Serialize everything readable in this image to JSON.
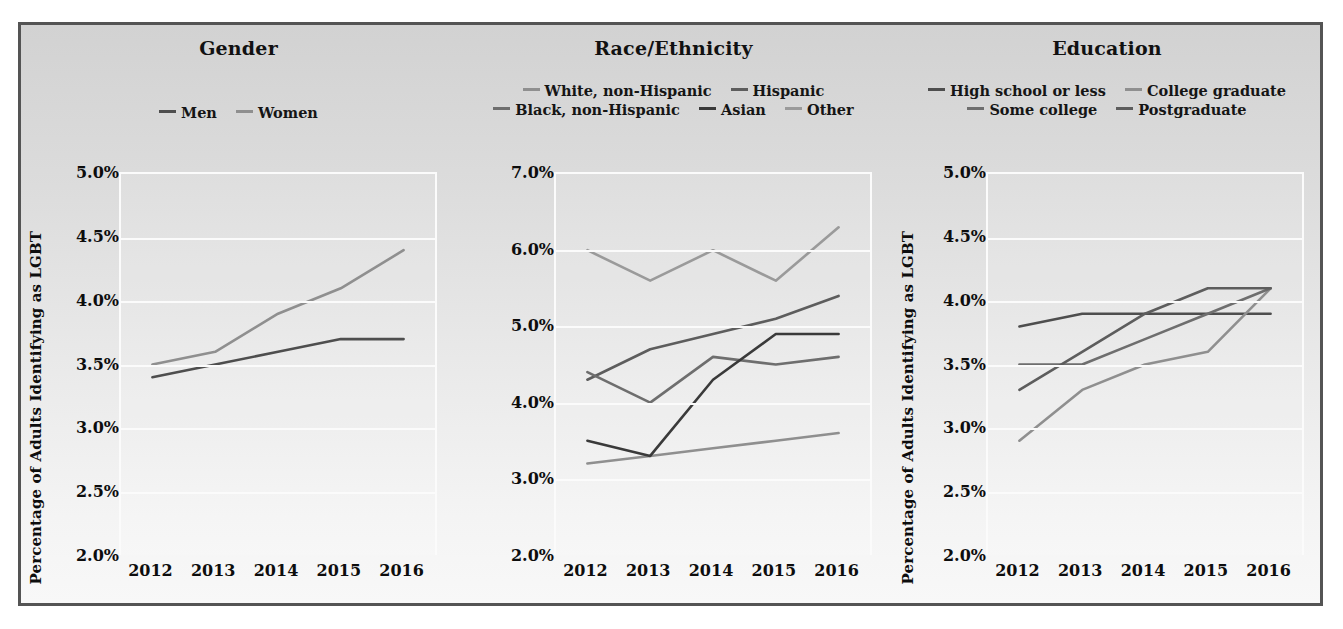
{
  "figure": {
    "background": "#dcdcdc",
    "border_color": "#545454",
    "ylabel": "Percentage of Adults Identifying as LGBT"
  },
  "colors": {
    "dark": "#4e4e4e",
    "mid_dark": "#5d5d5d",
    "mid": "#6e6e6e",
    "light": "#8f8f8f",
    "lighter": "#9a9a9a",
    "black": "#3a3a3a",
    "gridline": "#fbfbfb"
  },
  "panels": [
    {
      "id": "gender",
      "title": "Gender",
      "ylabel": "Percentage of Adults Identifying as LGBT",
      "yticks": [
        "5.0%",
        "4.5%",
        "4.0%",
        "3.5%",
        "3.0%",
        "2.5%",
        "2.0%"
      ],
      "ytick_values": [
        5.0,
        4.5,
        4.0,
        3.5,
        3.0,
        2.5,
        2.0
      ],
      "xticks": [
        "2012",
        "2013",
        "2014",
        "2015",
        "2016"
      ],
      "legend": [
        {
          "label": "Men",
          "color": "#4e4e4e"
        },
        {
          "label": "Women",
          "color": "#8f8f8f"
        }
      ]
    },
    {
      "id": "race",
      "title": "Race/Ethnicity",
      "ylabel": "Percentage of Adults Identifying as LGBT",
      "yticks": [
        "7.0%",
        "6.0%",
        "5.0%",
        "4.0%",
        "3.0%",
        "2.0%"
      ],
      "ytick_values": [
        7.0,
        6.0,
        5.0,
        4.0,
        3.0,
        2.0
      ],
      "xticks": [
        "2012",
        "2013",
        "2014",
        "2015",
        "2016"
      ],
      "legend": [
        {
          "label": "White, non-Hispanic",
          "color": "#8f8f8f"
        },
        {
          "label": "Hispanic",
          "color": "#5d5d5d"
        },
        {
          "label": "Black, non-Hispanic",
          "color": "#6e6e6e"
        },
        {
          "label": "Asian",
          "color": "#3a3a3a"
        },
        {
          "label": "Other",
          "color": "#9a9a9a"
        }
      ]
    },
    {
      "id": "education",
      "title": "Education",
      "ylabel": "Percentage of Adults Identifying as LGBT",
      "yticks": [
        "5.0%",
        "4.5%",
        "4.0%",
        "3.5%",
        "3.0%",
        "2.5%",
        "2.0%"
      ],
      "ytick_values": [
        5.0,
        4.5,
        4.0,
        3.5,
        3.0,
        2.5,
        2.0
      ],
      "xticks": [
        "2012",
        "2013",
        "2014",
        "2015",
        "2016"
      ],
      "legend": [
        {
          "label": "High school or less",
          "color": "#4e4e4e"
        },
        {
          "label": "College graduate",
          "color": "#8f8f8f"
        },
        {
          "label": "Some college",
          "color": "#6e6e6e"
        },
        {
          "label": "Postgraduate",
          "color": "#5d5d5d"
        }
      ]
    }
  ],
  "chart_data": [
    {
      "type": "line",
      "title": "Gender",
      "xlabel": "",
      "ylabel": "Percentage of Adults Identifying as LGBT",
      "x": [
        2012,
        2013,
        2014,
        2015,
        2016
      ],
      "ylim": [
        2.0,
        5.0
      ],
      "ytick_step": 0.5,
      "grid": true,
      "legend_position": "above-plot",
      "series": [
        {
          "name": "Men",
          "color": "#4e4e4e",
          "values": [
            3.4,
            3.5,
            3.6,
            3.7,
            3.7
          ]
        },
        {
          "name": "Women",
          "color": "#8f8f8f",
          "values": [
            3.5,
            3.6,
            3.9,
            4.1,
            4.4
          ]
        }
      ]
    },
    {
      "type": "line",
      "title": "Race/Ethnicity",
      "xlabel": "",
      "ylabel": "Percentage of Adults Identifying as LGBT",
      "x": [
        2012,
        2013,
        2014,
        2015,
        2016
      ],
      "ylim": [
        2.0,
        7.0
      ],
      "ytick_step": 1.0,
      "grid": true,
      "legend_position": "above-plot",
      "series": [
        {
          "name": "White, non-Hispanic",
          "color": "#8f8f8f",
          "values": [
            3.2,
            3.3,
            3.4,
            3.5,
            3.6
          ]
        },
        {
          "name": "Hispanic",
          "color": "#5d5d5d",
          "values": [
            4.3,
            4.7,
            4.9,
            5.1,
            5.4
          ]
        },
        {
          "name": "Black, non-Hispanic",
          "color": "#6e6e6e",
          "values": [
            4.4,
            4.0,
            4.6,
            4.5,
            4.6
          ]
        },
        {
          "name": "Asian",
          "color": "#3a3a3a",
          "values": [
            3.5,
            3.3,
            4.3,
            4.9,
            4.9
          ]
        },
        {
          "name": "Other",
          "color": "#9a9a9a",
          "values": [
            6.0,
            5.6,
            6.0,
            5.6,
            6.3
          ]
        }
      ]
    },
    {
      "type": "line",
      "title": "Education",
      "xlabel": "",
      "ylabel": "Percentage of Adults Identifying as LGBT",
      "x": [
        2012,
        2013,
        2014,
        2015,
        2016
      ],
      "ylim": [
        2.0,
        5.0
      ],
      "ytick_step": 0.5,
      "grid": true,
      "legend_position": "above-plot",
      "series": [
        {
          "name": "High school or less",
          "color": "#4e4e4e",
          "values": [
            3.8,
            3.9,
            3.9,
            3.9,
            3.9
          ]
        },
        {
          "name": "College graduate",
          "color": "#8f8f8f",
          "values": [
            2.9,
            3.3,
            3.5,
            3.6,
            4.1
          ]
        },
        {
          "name": "Some college",
          "color": "#6e6e6e",
          "values": [
            3.5,
            3.5,
            3.7,
            3.9,
            4.1
          ]
        },
        {
          "name": "Postgraduate",
          "color": "#5d5d5d",
          "values": [
            3.3,
            3.6,
            3.9,
            4.1,
            4.1
          ]
        }
      ]
    }
  ]
}
